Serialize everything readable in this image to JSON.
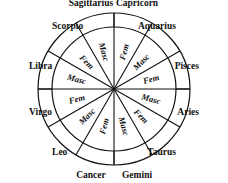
{
  "diagram": {
    "geometry": {
      "center_x": 114,
      "center_y": 89,
      "outer_radius": 76,
      "inner_radius": 62,
      "sector_count": 12,
      "sector_degrees": 30
    },
    "colors": {
      "stroke": "#111111",
      "background": "#ffffff",
      "text": "#111111"
    },
    "signs": [
      {
        "name": "Capricorn",
        "polarity": "Fem",
        "angle_deg": 285,
        "label_anchor": "middle"
      },
      {
        "name": "Sagittarius",
        "polarity": "Masc",
        "angle_deg": 255,
        "label_anchor": "middle"
      },
      {
        "name": "Scorpio",
        "polarity": "Fem",
        "angle_deg": 225,
        "label_anchor": "start"
      },
      {
        "name": "Libra",
        "polarity": "Masc",
        "angle_deg": 195,
        "label_anchor": "start"
      },
      {
        "name": "Virgo",
        "polarity": "Fem",
        "angle_deg": 165,
        "label_anchor": "start"
      },
      {
        "name": "Leo",
        "polarity": "Masc",
        "angle_deg": 135,
        "label_anchor": "start"
      },
      {
        "name": "Cancer",
        "polarity": "Fem",
        "angle_deg": 105,
        "label_anchor": "middle"
      },
      {
        "name": "Gemini",
        "polarity": "Masc",
        "angle_deg": 75,
        "label_anchor": "middle"
      },
      {
        "name": "Taurus",
        "polarity": "Fem",
        "angle_deg": 45,
        "label_anchor": "end"
      },
      {
        "name": "Aries",
        "polarity": "Masc",
        "angle_deg": 15,
        "label_anchor": "end"
      },
      {
        "name": "Pisces",
        "polarity": "Fem",
        "angle_deg": 345,
        "label_anchor": "end"
      },
      {
        "name": "Aquarius",
        "polarity": "Masc",
        "angle_deg": 315,
        "label_anchor": "end"
      }
    ]
  }
}
